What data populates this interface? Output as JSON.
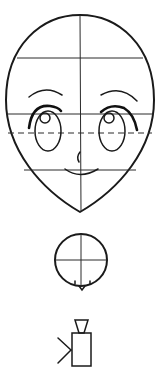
{
  "figure": {
    "colors": {
      "ink": "#1a1a1a",
      "background": "#ffffff"
    },
    "head": {
      "shape": "egg-oval",
      "guidelines": {
        "vertical_center": "solid",
        "horizontal": [
          "brow-top line",
          "eye line",
          "eye-center dashed line",
          "mouth line"
        ]
      },
      "features": [
        "eyebrows",
        "eyes with highlights",
        "nose",
        "mouth"
      ]
    },
    "side_diagram": {
      "shape": "circle",
      "guidelines": [
        "vertical center",
        "horizontal center"
      ],
      "marks": [
        "two small ticks",
        "chin point"
      ]
    },
    "camera_diagram": {
      "shape": "camera-icon",
      "marks": [
        "viewfinder trapezoid",
        "body rectangle",
        "view angle lines"
      ]
    }
  }
}
